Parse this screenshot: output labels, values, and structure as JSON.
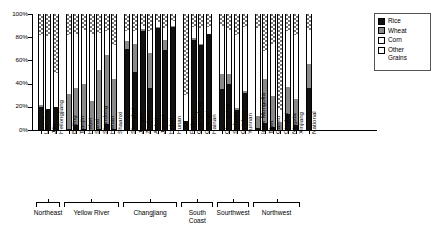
{
  "chart_data": {
    "type": "bar",
    "subtype": "stacked-100-percent",
    "title": "",
    "xlabel": "",
    "ylabel": "",
    "ylim": [
      0,
      100
    ],
    "ytick_labels": [
      "0%",
      "20%",
      "40%",
      "60%",
      "80%",
      "100%"
    ],
    "ytick_values": [
      0,
      20,
      40,
      60,
      80,
      100
    ],
    "grid": false,
    "legend_position": "top-right",
    "series": [
      {
        "name": "Rice",
        "key": "rice",
        "fill": "solid-black"
      },
      {
        "name": "Wheat",
        "key": "wheat",
        "fill": "solid-gray"
      },
      {
        "name": "Corn",
        "key": "corn",
        "fill": "white"
      },
      {
        "name": "Other Grains",
        "key": "other",
        "fill": "dotted"
      }
    ],
    "categories": [
      "Liaoning",
      "Jilin",
      "Heilongjiang",
      "Beijing",
      "Tianjin",
      "Hebei",
      "Sanxi",
      "Shandong",
      "Henan",
      "Shaanxi",
      "Shanghai",
      "Jiangsu",
      "Zhejiang",
      "Anhui",
      "Jiangxi",
      "Hubei",
      "Hunan",
      "Fujian",
      "Guangdong",
      "Guangxi",
      "Hainan",
      "Chongqing",
      "Sichuan",
      "Guizhou",
      "Yunnan",
      "Inner Mongolia",
      "Tibet",
      "Gansu",
      "Qinghai",
      "Ningxia",
      "Xinjiang",
      "National"
    ],
    "values": {
      "rice": [
        20,
        18,
        20,
        1,
        4,
        1,
        0,
        1,
        5,
        1,
        70,
        50,
        85,
        36,
        88,
        69,
        89,
        8,
        78,
        73,
        83,
        35,
        40,
        17,
        32,
        2,
        6,
        3,
        0,
        14,
        4,
        36
      ],
      "wheat": [
        2,
        0,
        0,
        30,
        32,
        39,
        25,
        51,
        60,
        43,
        7,
        24,
        2,
        30,
        1,
        9,
        1,
        0,
        1,
        1,
        0,
        13,
        8,
        2,
        2,
        10,
        38,
        26,
        7,
        23,
        23,
        21
      ],
      "corn": [
        60,
        63,
        29,
        51,
        47,
        46,
        58,
        32,
        20,
        29,
        8,
        11,
        3,
        19,
        4,
        10,
        4,
        22,
        10,
        14,
        6,
        42,
        38,
        63,
        55,
        76,
        24,
        45,
        10,
        48,
        55,
        29
      ],
      "other": [
        18,
        19,
        51,
        18,
        17,
        14,
        17,
        16,
        15,
        27,
        15,
        15,
        10,
        15,
        7,
        12,
        6,
        70,
        11,
        12,
        11,
        10,
        14,
        18,
        11,
        12,
        32,
        26,
        83,
        15,
        18,
        14
      ]
    },
    "groups": [
      {
        "label": "Northeast",
        "start": 0,
        "count": 3
      },
      {
        "label": "Yellow River",
        "start": 3,
        "count": 7
      },
      {
        "label": "Changjiang",
        "start": 10,
        "count": 7
      },
      {
        "label": "South Coast",
        "start": 17,
        "count": 4
      },
      {
        "label": "Sourthwest",
        "start": 21,
        "count": 4
      },
      {
        "label": "Northwest",
        "start": 25,
        "count": 6
      }
    ],
    "ungrouped_last": {
      "label": "National",
      "index": 31
    }
  },
  "legend": {
    "items": [
      {
        "label": "Rice"
      },
      {
        "label": "Wheat"
      },
      {
        "label": "Corn"
      },
      {
        "label": "Other",
        "label2": "Grains"
      }
    ]
  }
}
